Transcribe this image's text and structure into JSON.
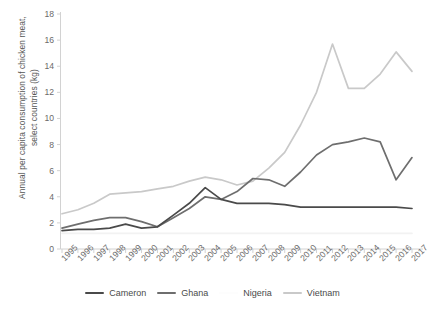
{
  "chart_data": {
    "type": "line",
    "title": "",
    "xlabel": "",
    "ylabel": "Annual per capita consumption of chicken meat,\nselect countries (kg)",
    "ylim": [
      0,
      18
    ],
    "yticks": [
      0,
      2,
      4,
      6,
      8,
      10,
      12,
      14,
      16,
      18
    ],
    "grid": false,
    "legend_position": "bottom",
    "x": [
      1995,
      1996,
      1997,
      1998,
      1999,
      2000,
      2001,
      2002,
      2003,
      2004,
      2005,
      2006,
      2007,
      2008,
      2009,
      2010,
      2011,
      2012,
      2013,
      2014,
      2015,
      2016,
      2017
    ],
    "series": [
      {
        "name": "Cameron",
        "color": "#4a4a4a",
        "values": [
          1.4,
          1.5,
          1.5,
          1.6,
          1.9,
          1.6,
          1.7,
          2.6,
          3.5,
          4.7,
          3.8,
          3.5,
          3.5,
          3.5,
          3.4,
          3.2,
          3.2,
          3.2,
          3.2,
          3.2,
          3.2,
          3.2,
          3.1
        ]
      },
      {
        "name": "Ghana",
        "color": "#6e6e6e",
        "values": [
          1.6,
          1.9,
          2.2,
          2.4,
          2.4,
          2.1,
          1.7,
          2.4,
          3.1,
          4.0,
          3.8,
          4.4,
          5.4,
          5.3,
          4.8,
          5.9,
          7.2,
          8.0,
          8.2,
          8.5,
          8.2,
          5.3,
          7.0
        ]
      },
      {
        "name": "Nigeria",
        "color": "#f2f2f2",
        "values": [
          1.2,
          1.2,
          1.2,
          1.2,
          1.2,
          1.2,
          1.2,
          1.2,
          1.2,
          1.2,
          1.2,
          1.2,
          1.2,
          1.2,
          1.2,
          1.2,
          1.2,
          1.2,
          1.2,
          1.2,
          1.2,
          1.2,
          1.2
        ]
      },
      {
        "name": "Vietnam",
        "color": "#c9c9c9",
        "values": [
          2.7,
          3.0,
          3.5,
          4.2,
          4.3,
          4.4,
          4.6,
          4.8,
          5.2,
          5.5,
          5.3,
          4.9,
          5.2,
          6.2,
          7.4,
          9.5,
          12.0,
          15.7,
          12.3,
          12.3,
          13.4,
          15.1,
          13.6
        ]
      }
    ]
  },
  "legend": {
    "items": [
      {
        "label": "Cameron",
        "color": "#4a4a4a"
      },
      {
        "label": "Ghana",
        "color": "#6e6e6e"
      },
      {
        "label": "Nigeria",
        "color": "#fdfdfd"
      },
      {
        "label": "Vietnam",
        "color": "#c9c9c9"
      }
    ]
  },
  "axis": {
    "y_title": "Annual per capita consumption of chicken meat,\nselect countries (kg)",
    "y_tick_labels": [
      "18",
      "16",
      "14",
      "12",
      "10",
      "8",
      "6",
      "4",
      "2",
      "0"
    ],
    "x_tick_labels": [
      "1995",
      "1996",
      "1997",
      "1998",
      "1999",
      "2000",
      "2001",
      "2002",
      "2003",
      "2004",
      "2005",
      "2006",
      "2007",
      "2008",
      "2009",
      "2010",
      "2011",
      "2012",
      "2013",
      "2014",
      "2015",
      "2016",
      "2017"
    ]
  },
  "colors": {
    "axis_line": "#d2d2d2",
    "tick_text": "#6b6b6b",
    "label_text": "#555555",
    "background": "#ffffff"
  }
}
